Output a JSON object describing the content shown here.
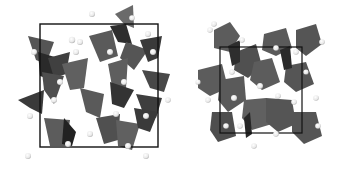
{
  "figure": {
    "panels": [
      {
        "id": "left",
        "description": "Crystal structure viewed along axis: corner-sharing tetrahedra with cations, unit cell outlined",
        "cell_box": {
          "x": 40,
          "y": 24,
          "w": 118,
          "h": 123
        },
        "polyhedron_type": "tetrahedra"
      },
      {
        "id": "right",
        "description": "Crystal structure viewed along axis: densely packed octahedra with cations, unit cell outlined",
        "cell_box": {
          "x": 220,
          "y": 47,
          "w": 82,
          "h": 86
        },
        "polyhedron_type": "octahedra"
      }
    ],
    "colors": {
      "polyhedron_light": "#6a6a6a",
      "polyhedron_mid": "#505050",
      "polyhedron_dark": "#2e2e2e",
      "atom": "#f2f2f2",
      "atom_edge": "#bdbdbd",
      "cell_line": "#111111",
      "background": "#ffffff"
    }
  }
}
